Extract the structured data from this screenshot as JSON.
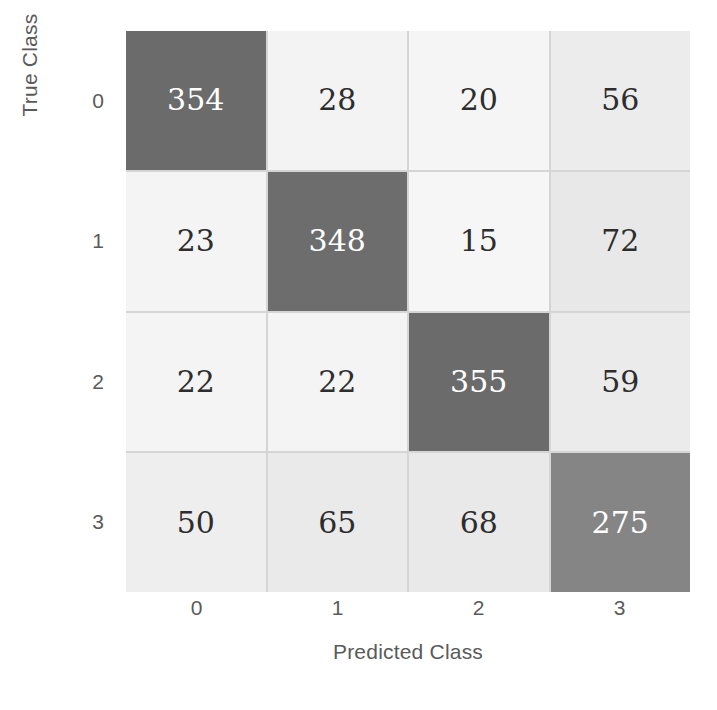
{
  "chart_data": {
    "type": "heatmap",
    "subtype": "confusion-matrix",
    "title": "",
    "xlabel": "Predicted Class",
    "ylabel": "True Class",
    "xticklabels": [
      "0",
      "1",
      "2",
      "3"
    ],
    "yticklabels": [
      "0",
      "1",
      "2",
      "3"
    ],
    "categories": [
      "0",
      "1",
      "2",
      "3"
    ],
    "grid": true,
    "legend": "none",
    "colormap": "grayscale-reversed",
    "value_range": [
      15,
      355
    ],
    "rows": [
      {
        "true_class": "0",
        "cells": [
          {
            "predicted_class": "0",
            "value": "354",
            "fill": "#6b6b6b",
            "text_color": "#ffffff",
            "diagonal": true
          },
          {
            "predicted_class": "1",
            "value": "28",
            "fill": "#f3f3f3",
            "text_color": "#2d2d2d",
            "diagonal": false
          },
          {
            "predicted_class": "2",
            "value": "20",
            "fill": "#f5f5f5",
            "text_color": "#2d2d2d",
            "diagonal": false
          },
          {
            "predicted_class": "3",
            "value": "56",
            "fill": "#ececec",
            "text_color": "#2d2d2d",
            "diagonal": false
          }
        ]
      },
      {
        "true_class": "1",
        "cells": [
          {
            "predicted_class": "0",
            "value": "23",
            "fill": "#f4f4f4",
            "text_color": "#2d2d2d",
            "diagonal": false
          },
          {
            "predicted_class": "1",
            "value": "348",
            "fill": "#6d6d6d",
            "text_color": "#ffffff",
            "diagonal": true
          },
          {
            "predicted_class": "2",
            "value": "15",
            "fill": "#f6f6f6",
            "text_color": "#2d2d2d",
            "diagonal": false
          },
          {
            "predicted_class": "3",
            "value": "72",
            "fill": "#e8e8e8",
            "text_color": "#2d2d2d",
            "diagonal": false
          }
        ]
      },
      {
        "true_class": "2",
        "cells": [
          {
            "predicted_class": "0",
            "value": "22",
            "fill": "#f4f4f4",
            "text_color": "#2d2d2d",
            "diagonal": false
          },
          {
            "predicted_class": "1",
            "value": "22",
            "fill": "#f4f4f4",
            "text_color": "#2d2d2d",
            "diagonal": false
          },
          {
            "predicted_class": "2",
            "value": "355",
            "fill": "#6b6b6b",
            "text_color": "#ffffff",
            "diagonal": true
          },
          {
            "predicted_class": "3",
            "value": "59",
            "fill": "#ebebeb",
            "text_color": "#2d2d2d",
            "diagonal": false
          }
        ]
      },
      {
        "true_class": "3",
        "cells": [
          {
            "predicted_class": "0",
            "value": "50",
            "fill": "#eeeeee",
            "text_color": "#2d2d2d",
            "diagonal": false
          },
          {
            "predicted_class": "1",
            "value": "65",
            "fill": "#eaeaea",
            "text_color": "#2d2d2d",
            "diagonal": false
          },
          {
            "predicted_class": "2",
            "value": "68",
            "fill": "#e9e9e9",
            "text_color": "#2d2d2d",
            "diagonal": false
          },
          {
            "predicted_class": "3",
            "value": "275",
            "fill": "#858585",
            "text_color": "#ffffff",
            "diagonal": true
          }
        ]
      }
    ],
    "values": [
      [
        354,
        28,
        20,
        56
      ],
      [
        23,
        348,
        15,
        72
      ],
      [
        22,
        22,
        355,
        59
      ],
      [
        50,
        65,
        68,
        275
      ]
    ]
  },
  "style": {
    "background": "#ffffff",
    "grid_line_color": "#d5d5d5",
    "axis_text_color": "#5a5a5a"
  }
}
